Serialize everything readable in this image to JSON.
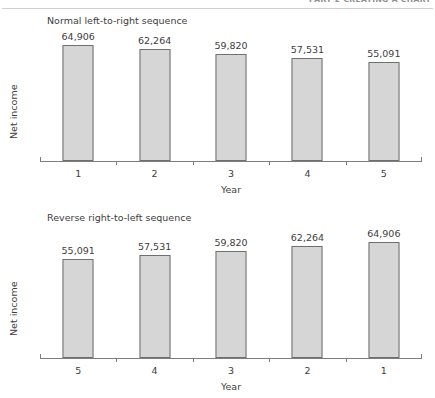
{
  "page": {
    "running_head": "PART 2  CREATING A CHART",
    "background": "#ffffff"
  },
  "style": {
    "bar_fill": "#d6d6d6",
    "bar_stroke": "#6f6f6f",
    "axis_color": "#7d7d7d",
    "text_color": "#3d3d3d"
  },
  "chart_data": [
    {
      "type": "bar",
      "title": "Normal left-to-right sequence",
      "xlabel": "Year",
      "ylabel": "Net income",
      "categories": [
        "1",
        "2",
        "3",
        "4",
        "5"
      ],
      "values": [
        64906,
        62264,
        59820,
        57531,
        55091
      ],
      "value_labels": [
        "64,906",
        "62,264",
        "59,820",
        "57,531",
        "55,091"
      ],
      "ylim": [
        0,
        72000
      ],
      "grid": false,
      "legend": "none",
      "y_ticks": []
    },
    {
      "type": "bar",
      "title": "Reverse right-to-left sequence",
      "xlabel": "Year",
      "ylabel": "Net income",
      "categories": [
        "5",
        "4",
        "3",
        "2",
        "1"
      ],
      "values": [
        55091,
        57531,
        59820,
        62264,
        64906
      ],
      "value_labels": [
        "55,091",
        "57,531",
        "59,820",
        "62,264",
        "64,906"
      ],
      "ylim": [
        0,
        72000
      ],
      "grid": false,
      "legend": "none",
      "y_ticks": []
    }
  ]
}
